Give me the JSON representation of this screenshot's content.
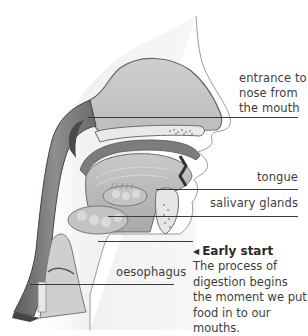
{
  "diagram": {
    "labels": {
      "nose_entrance": "entrance to nose from the mouth",
      "nose_entrance_lines": [
        "entrance to",
        "nose from",
        "the mouth"
      ],
      "tongue": "tongue",
      "salivary_glands": "salivary glands",
      "oesophagus": "oesophagus"
    },
    "caption": {
      "arrow_icon": "◀",
      "title": "Early start",
      "body": "The process of digestion begins the moment we put food in to our mouths."
    },
    "colors": {
      "tissue_light": "#d9d9d9",
      "tissue_mid": "#b5b5b5",
      "tissue_dark": "#6e6e6e",
      "outline": "#555555",
      "leader_line": "#3a3a3a",
      "text": "#3d3d3d"
    }
  }
}
